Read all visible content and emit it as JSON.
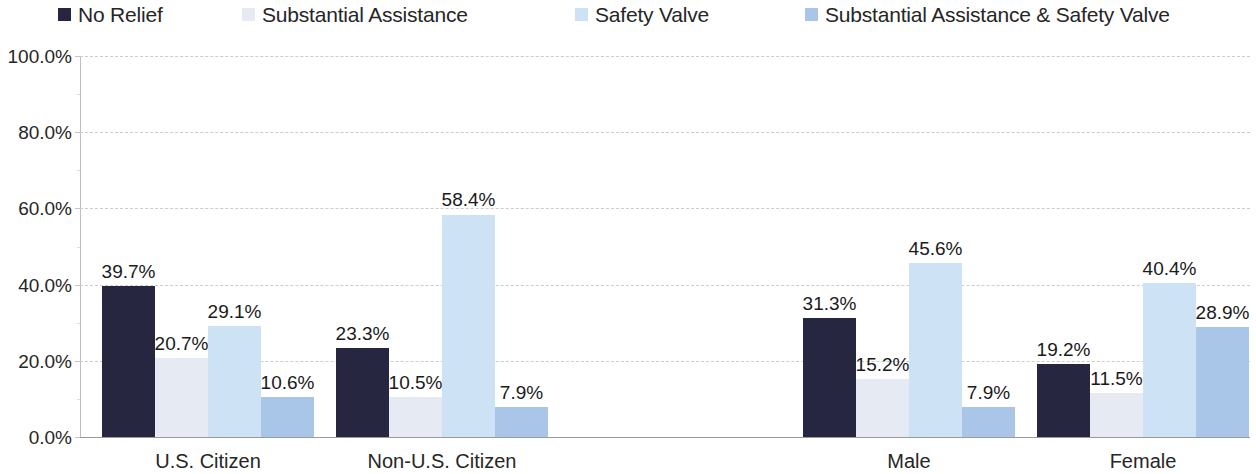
{
  "legend": {
    "items": [
      {
        "label": "No Relief",
        "color": "#262640",
        "x": 58
      },
      {
        "label": "Substantial Assistance",
        "color": "#e6ebf3",
        "x": 242
      },
      {
        "label": "Safety Valve",
        "color": "#cde2f4",
        "x": 575
      },
      {
        "label": "Substantial Assistance & Safety Valve",
        "color": "#a9c6e8",
        "x": 805
      }
    ]
  },
  "axis": {
    "y_ticks": [
      "100.0%",
      "80.0%",
      "60.0%",
      "40.0%",
      "20.0%",
      "0.0%"
    ],
    "x_labels": [
      "U.S. Citizen",
      "Non-U.S. Citizen",
      "",
      "Male",
      "Female"
    ]
  },
  "chart_data": {
    "type": "bar",
    "title": "",
    "xlabel": "",
    "ylabel": "",
    "ylim": [
      0,
      100
    ],
    "ytick_values": [
      0,
      20,
      40,
      60,
      80,
      100
    ],
    "grid": true,
    "legend_position": "top",
    "categories": [
      "U.S. Citizen",
      "Non-U.S. Citizen",
      "",
      "Male",
      "Female"
    ],
    "series": [
      {
        "name": "No Relief",
        "color": "#262640",
        "values": [
          39.7,
          23.3,
          null,
          31.3,
          19.2
        ],
        "labels": [
          "39.7%",
          "23.3%",
          "",
          "31.3%",
          "19.2%"
        ]
      },
      {
        "name": "Substantial Assistance",
        "color": "#e6ebf3",
        "values": [
          20.7,
          10.5,
          null,
          15.2,
          11.5
        ],
        "labels": [
          "20.7%",
          "10.5%",
          "",
          "15.2%",
          "11.5%"
        ]
      },
      {
        "name": "Safety Valve",
        "color": "#cde2f4",
        "values": [
          29.1,
          58.4,
          null,
          45.6,
          40.4
        ],
        "labels": [
          "29.1%",
          "58.4%",
          "",
          "45.6%",
          "40.4%"
        ]
      },
      {
        "name": "Substantial Assistance & Safety Valve",
        "color": "#a9c6e8",
        "values": [
          10.6,
          7.9,
          null,
          7.9,
          28.9
        ],
        "labels": [
          "10.6%",
          "7.9%",
          "",
          "7.9%",
          "28.9%"
        ]
      }
    ]
  },
  "geometry": {
    "plot_left": 80,
    "plot_top": 56,
    "plot_width": 1170,
    "plot_height": 381,
    "bar_width": 53,
    "group_starts": [
      102,
      336,
      570,
      803,
      1037
    ]
  }
}
